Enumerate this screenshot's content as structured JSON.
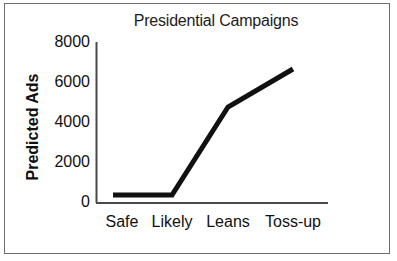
{
  "figure": {
    "title": "Presidential Campaigns",
    "background_color": "#ffffff",
    "border_color": "#6e6e6e",
    "line_color": "#111111"
  },
  "chart_data": {
    "type": "line",
    "title": "Presidential Campaigns",
    "xlabel": "",
    "ylabel": "Predicted Ads",
    "categories": [
      "Safe",
      "Likely",
      "Leans",
      "Toss-up"
    ],
    "values": [
      300,
      300,
      4700,
      6600
    ],
    "series": [
      {
        "name": "Predicted Ads",
        "values": [
          300,
          300,
          4700,
          6600
        ]
      }
    ],
    "ylim": [
      0,
      8000
    ],
    "yticks": [
      0,
      2000,
      4000,
      6000,
      8000
    ],
    "ytick_labels": [
      "0",
      "2000",
      "4000",
      "6000",
      "8000"
    ],
    "xtick_labels": [
      "Safe",
      "Likely",
      "Leans",
      "Toss-up"
    ],
    "grid": false,
    "legend": false,
    "legend_position": "none",
    "line_width": 5,
    "line_color": "#111111"
  },
  "axes": {
    "y_axis_title": "Predicted Ads",
    "y_tick_values": [
      "8000",
      "6000",
      "4000",
      "2000",
      "0"
    ],
    "x_tick_values": [
      "Safe",
      "Likely",
      "Leans",
      "Toss-up"
    ]
  }
}
